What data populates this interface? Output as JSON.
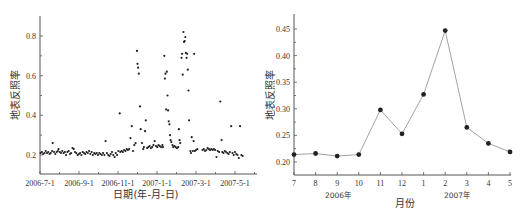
{
  "chart_data": [
    {
      "type": "scatter",
      "title": "",
      "xlabel": "日期(年-月-日)",
      "ylabel": "地表反照率",
      "x_tick_labels": [
        "2006-7-1",
        "2006-9-1",
        "2006-11-1",
        "2007-1-1",
        "2007-3-1",
        "2007-5-1"
      ],
      "y_tick_labels": [
        "0.2",
        "0.4",
        "0.6",
        "0.8"
      ],
      "ylim": [
        0.1,
        0.9
      ],
      "xlim_days": [
        0,
        335
      ],
      "grid": false,
      "legend": null,
      "x_unit": "days since 2006-7-1",
      "points": [
        [
          1,
          0.21
        ],
        [
          3,
          0.215
        ],
        [
          5,
          0.205
        ],
        [
          7,
          0.21
        ],
        [
          9,
          0.22
        ],
        [
          11,
          0.21
        ],
        [
          13,
          0.215
        ],
        [
          15,
          0.205
        ],
        [
          17,
          0.21
        ],
        [
          19,
          0.22
        ],
        [
          20,
          0.26
        ],
        [
          22,
          0.215
        ],
        [
          24,
          0.205
        ],
        [
          26,
          0.215
        ],
        [
          28,
          0.22
        ],
        [
          29,
          0.23
        ],
        [
          31,
          0.215
        ],
        [
          33,
          0.21
        ],
        [
          35,
          0.22
        ],
        [
          37,
          0.21
        ],
        [
          39,
          0.215
        ],
        [
          41,
          0.2
        ],
        [
          43,
          0.215
        ],
        [
          45,
          0.22
        ],
        [
          47,
          0.205
        ],
        [
          49,
          0.21
        ],
        [
          51,
          0.235
        ],
        [
          53,
          0.23
        ],
        [
          55,
          0.215
        ],
        [
          57,
          0.21
        ],
        [
          59,
          0.2
        ],
        [
          61,
          0.205
        ],
        [
          63,
          0.21
        ],
        [
          65,
          0.2
        ],
        [
          67,
          0.215
        ],
        [
          69,
          0.21
        ],
        [
          71,
          0.205
        ],
        [
          73,
          0.215
        ],
        [
          75,
          0.21
        ],
        [
          77,
          0.22
        ],
        [
          79,
          0.205
        ],
        [
          81,
          0.215
        ],
        [
          83,
          0.2
        ],
        [
          85,
          0.21
        ],
        [
          87,
          0.205
        ],
        [
          89,
          0.21
        ],
        [
          91,
          0.2
        ],
        [
          93,
          0.21
        ],
        [
          95,
          0.205
        ],
        [
          97,
          0.2
        ],
        [
          99,
          0.21
        ],
        [
          101,
          0.2
        ],
        [
          103,
          0.27
        ],
        [
          105,
          0.21
        ],
        [
          107,
          0.2
        ],
        [
          109,
          0.195
        ],
        [
          111,
          0.205
        ],
        [
          113,
          0.215
        ],
        [
          115,
          0.2
        ],
        [
          117,
          0.19
        ],
        [
          119,
          0.21
        ],
        [
          121,
          0.2
        ],
        [
          123,
          0.22
        ],
        [
          125,
          0.41
        ],
        [
          126,
          0.215
        ],
        [
          128,
          0.22
        ],
        [
          130,
          0.215
        ],
        [
          132,
          0.225
        ],
        [
          134,
          0.22
        ],
        [
          136,
          0.23
        ],
        [
          138,
          0.225
        ],
        [
          140,
          0.23
        ],
        [
          142,
          0.285
        ],
        [
          144,
          0.345
        ],
        [
          146,
          0.22
        ],
        [
          148,
          0.25
        ],
        [
          150,
          0.26
        ],
        [
          152,
          0.725
        ],
        [
          153,
          0.66
        ],
        [
          154,
          0.64
        ],
        [
          155,
          0.61
        ],
        [
          157,
          0.445
        ],
        [
          158,
          0.33
        ],
        [
          160,
          0.26
        ],
        [
          162,
          0.23
        ],
        [
          163,
          0.24
        ],
        [
          165,
          0.32
        ],
        [
          166,
          0.375
        ],
        [
          168,
          0.235
        ],
        [
          170,
          0.24
        ],
        [
          172,
          0.245
        ],
        [
          174,
          0.235
        ],
        [
          176,
          0.24
        ],
        [
          178,
          0.25
        ],
        [
          180,
          0.27
        ],
        [
          182,
          0.245
        ],
        [
          184,
          0.24
        ],
        [
          186,
          0.25
        ],
        [
          188,
          0.245
        ],
        [
          190,
          0.24
        ],
        [
          192,
          0.25
        ],
        [
          193,
          0.24
        ],
        [
          195,
          0.7
        ],
        [
          196,
          0.585
        ],
        [
          197,
          0.61
        ],
        [
          198,
          0.43
        ],
        [
          199,
          0.62
        ],
        [
          200,
          0.5
        ],
        [
          201,
          0.425
        ],
        [
          202,
          0.37
        ],
        [
          203,
          0.355
        ],
        [
          204,
          0.3
        ],
        [
          205,
          0.275
        ],
        [
          206,
          0.265
        ],
        [
          208,
          0.25
        ],
        [
          209,
          0.24
        ],
        [
          211,
          0.245
        ],
        [
          213,
          0.24
        ],
        [
          215,
          0.235
        ],
        [
          217,
          0.24
        ],
        [
          218,
          0.33
        ],
        [
          219,
          0.275
        ],
        [
          220,
          0.26
        ],
        [
          222,
          0.69
        ],
        [
          223,
          0.71
        ],
        [
          224,
          0.605
        ],
        [
          225,
          0.82
        ],
        [
          226,
          0.77
        ],
        [
          227,
          0.775
        ],
        [
          228,
          0.795
        ],
        [
          229,
          0.715
        ],
        [
          230,
          0.69
        ],
        [
          231,
          0.71
        ],
        [
          232,
          0.63
        ],
        [
          233,
          0.525
        ],
        [
          234,
          0.375
        ],
        [
          236,
          0.22
        ],
        [
          237,
          0.21
        ],
        [
          238,
          0.29
        ],
        [
          240,
          0.22
        ],
        [
          241,
          0.27
        ],
        [
          242,
          0.71
        ],
        [
          243,
          0.22
        ],
        [
          245,
          0.225
        ],
        [
          247,
          0.23
        ],
        [
          255,
          0.225
        ],
        [
          257,
          0.23
        ],
        [
          259,
          0.22
        ],
        [
          261,
          0.225
        ],
        [
          263,
          0.235
        ],
        [
          265,
          0.23
        ],
        [
          267,
          0.225
        ],
        [
          269,
          0.23
        ],
        [
          271,
          0.225
        ],
        [
          273,
          0.23
        ],
        [
          275,
          0.225
        ],
        [
          277,
          0.19
        ],
        [
          279,
          0.22
        ],
        [
          281,
          0.215
        ],
        [
          283,
          0.47
        ],
        [
          285,
          0.275
        ],
        [
          286,
          0.215
        ],
        [
          288,
          0.21
        ],
        [
          290,
          0.22
        ],
        [
          292,
          0.215
        ],
        [
          294,
          0.21
        ],
        [
          296,
          0.205
        ],
        [
          298,
          0.215
        ],
        [
          300,
          0.345
        ],
        [
          302,
          0.21
        ],
        [
          304,
          0.2
        ],
        [
          306,
          0.215
        ],
        [
          308,
          0.205
        ],
        [
          310,
          0.2
        ],
        [
          312,
          0.185
        ],
        [
          314,
          0.345
        ],
        [
          316,
          0.2
        ],
        [
          318,
          0.195
        ]
      ]
    },
    {
      "type": "line",
      "title": "",
      "xlabel": "月份",
      "ylabel": "地表反照率",
      "categories": [
        "7",
        "8",
        "9",
        "10",
        "11",
        "12",
        "1",
        "2",
        "3",
        "4",
        "5"
      ],
      "year_labels": [
        "2006年",
        "2007年"
      ],
      "values": [
        0.214,
        0.216,
        0.211,
        0.214,
        0.298,
        0.253,
        0.327,
        0.447,
        0.265,
        0.235,
        0.219
      ],
      "y_tick_labels": [
        "0.20",
        "0.25",
        "0.30",
        "0.35",
        "0.40",
        "0.45"
      ],
      "ylim": [
        0.185,
        0.47
      ],
      "grid": false,
      "legend": null,
      "marker": "circle"
    }
  ]
}
